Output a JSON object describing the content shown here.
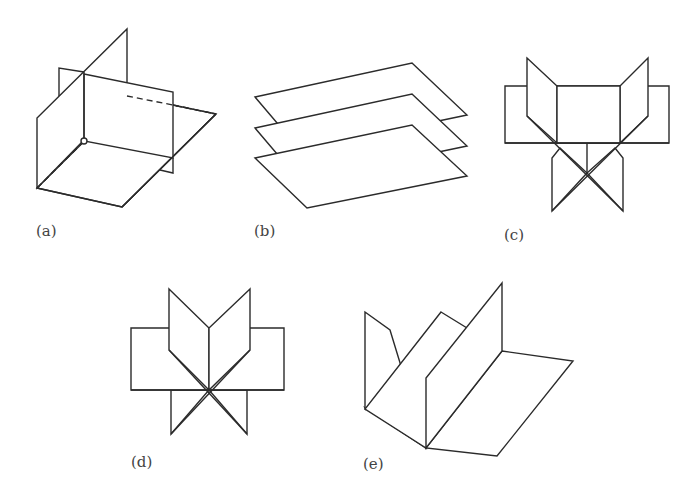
{
  "figure": {
    "panels": [
      {
        "id": "a",
        "label": "(a)",
        "description": "three mutually perpendicular intersecting planes with a marked origin point"
      },
      {
        "id": "b",
        "label": "(b)",
        "description": "three parallel stacked planes"
      },
      {
        "id": "c",
        "label": "(c)",
        "description": "planes meeting along parallel lines forming a prism-like arrangement"
      },
      {
        "id": "d",
        "label": "(d)",
        "description": "several planes intersecting in a single line (sheaf of planes)"
      },
      {
        "id": "e",
        "label": "(e)",
        "description": "three half-planes meeting along a common line"
      }
    ],
    "colors": {
      "stroke": "#2b2b2b",
      "label": "#444444",
      "background": "#ffffff"
    }
  }
}
